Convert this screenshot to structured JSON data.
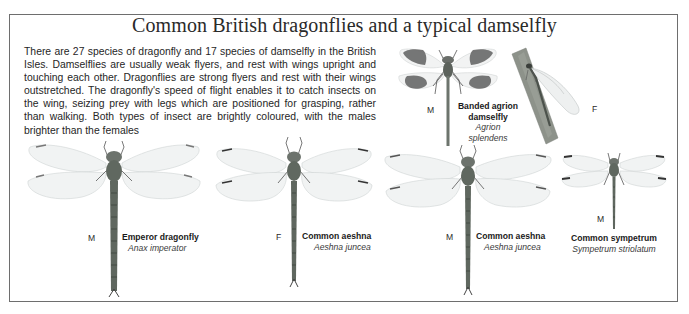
{
  "title": "Common British dragonflies and a typical damselfly",
  "intro_text": "There are 27 species of dragonfly and 17 species of damselfly in the British Isles. Damselflies are usually weak flyers, and rest with wings upright and touching each other. Dragonflies are strong flyers and rest with their wings outstretched. The dragonfly's speed of flight enables it to catch insects on the wing, seizing prey with legs which are positioned for grasping, rather than walking. Both types of insect are brightly coloured, with the males brighter than the females",
  "colors": {
    "frame": "#6e6e6e",
    "wing": "#eef0f0",
    "wing_band": "#5a5a5a",
    "body": "#5c6660",
    "stem": "#8c918a"
  },
  "species": [
    {
      "id": "banded-agrion-male",
      "sex": "M",
      "common_name": "Banded agrion damselfly",
      "common_name_line1": "Banded agrion",
      "common_name_line2": "damselfly",
      "scientific_name": "Agrion splendens"
    },
    {
      "id": "banded-agrion-female",
      "sex": "F"
    },
    {
      "id": "emperor-dragonfly",
      "sex": "M",
      "common_name": "Emperor dragonfly",
      "scientific_name": "Anax imperator"
    },
    {
      "id": "common-aeshna-female",
      "sex": "F",
      "common_name": "Common aeshna",
      "scientific_name": "Aeshna juncea"
    },
    {
      "id": "common-aeshna-male",
      "sex": "M",
      "common_name": "Common aeshna",
      "scientific_name": "Aeshna juncea"
    },
    {
      "id": "common-sympetrum",
      "sex": "M",
      "common_name": "Common sympetrum",
      "scientific_name": "Sympetrum striolatum"
    }
  ]
}
